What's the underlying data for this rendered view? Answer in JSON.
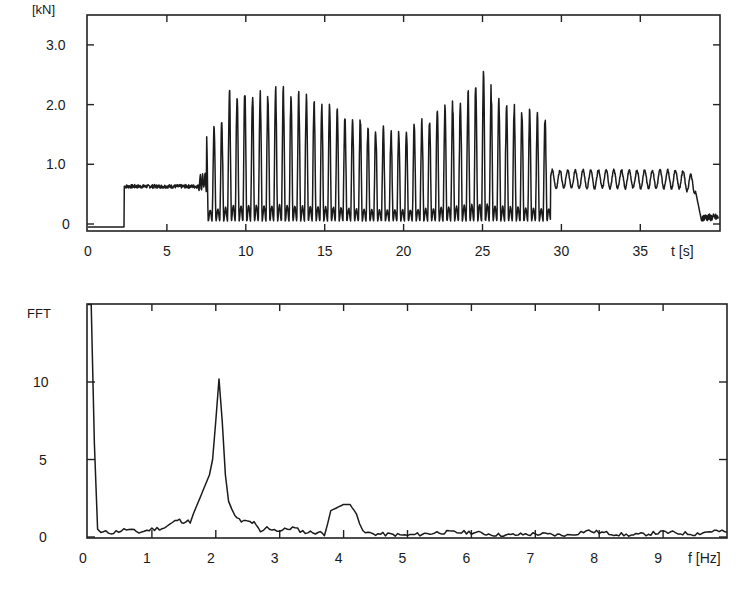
{
  "chart_data": [
    {
      "type": "line",
      "title": "",
      "ylabel": "[kN]",
      "xlabel": "t [s]",
      "xlim": [
        0,
        40
      ],
      "ylim": [
        -0.1,
        3.3
      ],
      "xticks": [
        0,
        5,
        10,
        15,
        20,
        25,
        30,
        35
      ],
      "xtick_labels": [
        "0",
        "5",
        "10",
        "15",
        "20",
        "25",
        "30",
        "35"
      ],
      "yticks": [
        0,
        1.0,
        2.0,
        3.0
      ],
      "ytick_labels": [
        "0",
        "1.0",
        "2.0",
        "3.0"
      ],
      "grid": false,
      "segments": [
        {
          "t_start": 0.0,
          "t_end": 2.3,
          "description": "baseline",
          "level": -0.05
        },
        {
          "t_start": 2.3,
          "t_end": 7.0,
          "description": "static load plateau",
          "level": 0.63
        },
        {
          "t_start": 7.0,
          "t_end": 7.5,
          "description": "transition noise",
          "level": 0.7
        },
        {
          "t_start": 7.5,
          "t_end": 29.3,
          "description": "large oscillation ~2 Hz",
          "frequency_hz": 2.05,
          "min": 0.0,
          "peak_envelope": [
            {
              "t": 7.5,
              "peak": 1.5
            },
            {
              "t": 8.5,
              "peak": 1.7
            },
            {
              "t": 9.0,
              "peak": 2.25
            },
            {
              "t": 11.0,
              "peak": 2.2
            },
            {
              "t": 12.0,
              "peak": 2.25
            },
            {
              "t": 14.0,
              "peak": 2.1
            },
            {
              "t": 16.0,
              "peak": 1.9
            },
            {
              "t": 18.0,
              "peak": 1.6
            },
            {
              "t": 20.0,
              "peak": 1.55
            },
            {
              "t": 22.0,
              "peak": 1.85
            },
            {
              "t": 24.0,
              "peak": 2.2
            },
            {
              "t": 25.0,
              "peak": 2.5
            },
            {
              "t": 26.0,
              "peak": 2.1
            },
            {
              "t": 28.0,
              "peak": 1.85
            },
            {
              "t": 29.3,
              "peak": 1.8
            }
          ]
        },
        {
          "t_start": 29.3,
          "t_end": 38.5,
          "description": "small oscillation ~2 Hz",
          "frequency_hz": 2.05,
          "min": 0.55,
          "max": 0.95
        },
        {
          "t_start": 38.5,
          "t_end": 40.0,
          "description": "unloading",
          "level": 0.0
        }
      ]
    },
    {
      "type": "line",
      "title": "",
      "ylabel": "FFT",
      "xlabel": "f [Hz]",
      "xlim": [
        0,
        10
      ],
      "ylim": [
        0,
        15
      ],
      "xticks": [
        0,
        1,
        2,
        3,
        4,
        5,
        6,
        7,
        8,
        9
      ],
      "xtick_labels": [
        "0",
        "1",
        "2",
        "3",
        "4",
        "5",
        "6",
        "7",
        "8",
        "9"
      ],
      "yticks": [
        0,
        5,
        10
      ],
      "ytick_labels": [
        "0",
        "5",
        "10"
      ],
      "grid": false,
      "x": [
        0.0,
        0.05,
        0.1,
        0.15,
        0.2,
        0.4,
        0.6,
        0.8,
        1.0,
        1.2,
        1.4,
        1.5,
        1.6,
        1.7,
        1.8,
        1.9,
        1.95,
        2.0,
        2.05,
        2.1,
        2.15,
        2.2,
        2.3,
        2.4,
        2.5,
        2.6,
        2.7,
        2.8,
        3.0,
        3.2,
        3.4,
        3.6,
        3.7,
        3.8,
        4.0,
        4.1,
        4.2,
        4.3,
        4.5,
        5.0,
        5.5,
        6.0,
        6.5,
        7.0,
        7.5,
        7.8,
        8.0,
        8.5,
        9.0,
        9.5,
        9.8,
        10.0
      ],
      "values": [
        15.0,
        15.0,
        6.0,
        0.5,
        0.3,
        0.3,
        0.5,
        0.3,
        0.5,
        0.6,
        1.1,
        1.0,
        1.0,
        2.0,
        3.0,
        4.0,
        5.0,
        7.5,
        10.2,
        7.5,
        4.0,
        2.3,
        1.3,
        1.0,
        1.0,
        0.9,
        0.3,
        0.6,
        0.4,
        0.6,
        0.3,
        0.3,
        0.2,
        1.7,
        2.1,
        2.1,
        1.5,
        0.3,
        0.2,
        0.1,
        0.3,
        0.3,
        0.1,
        0.2,
        0.1,
        0.4,
        0.3,
        0.1,
        0.3,
        0.2,
        0.4,
        0.3
      ],
      "annotations": [
        {
          "x": 2.05,
          "y": 10.2,
          "text": "dominant peak ~2 Hz"
        },
        {
          "x": 4.0,
          "y": 2.1,
          "text": "second harmonic ~4 Hz"
        }
      ]
    }
  ],
  "top_plot": {
    "ylabel": "[kN]",
    "xlabel": "t [s]",
    "yticks": [
      "0",
      "1.0",
      "2.0",
      "3.0"
    ],
    "xticks": [
      "0",
      "5",
      "10",
      "15",
      "20",
      "25",
      "30",
      "35"
    ]
  },
  "bottom_plot": {
    "ylabel": "FFT",
    "xlabel": "f [Hz]",
    "yticks": [
      "0",
      "5",
      "10"
    ],
    "xticks": [
      "0",
      "1",
      "2",
      "3",
      "4",
      "5",
      "6",
      "7",
      "8",
      "9"
    ]
  },
  "colors": {
    "line": "#1b1b1b",
    "frame": "#222222",
    "background": "#ffffff"
  }
}
